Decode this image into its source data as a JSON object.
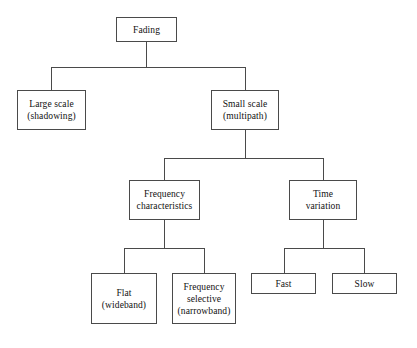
{
  "diagram": {
    "type": "hierarchy-tree",
    "colors": {
      "background": "#ffffff",
      "border": "#4a4a4a",
      "text": "#111111"
    },
    "nodes": [
      {
        "id": "fading",
        "lines": [
          "Fading"
        ],
        "x": 116,
        "y": 17,
        "w": 61,
        "h": 25,
        "level": 0
      },
      {
        "id": "large-scale",
        "lines": [
          "Large scale",
          "(shadowing)"
        ],
        "x": 17,
        "y": 90,
        "w": 69,
        "h": 40,
        "level": 1
      },
      {
        "id": "small-scale",
        "lines": [
          "Small scale",
          "(multipath)"
        ],
        "x": 211,
        "y": 90,
        "w": 68,
        "h": 40,
        "level": 1
      },
      {
        "id": "frequency-characteristics",
        "lines": [
          "Frequency",
          "characteristics"
        ],
        "x": 129,
        "y": 180,
        "w": 71,
        "h": 40,
        "level": 2
      },
      {
        "id": "time-variation",
        "lines": [
          "Time",
          "variation"
        ],
        "x": 289,
        "y": 180,
        "w": 68,
        "h": 40,
        "level": 2
      },
      {
        "id": "flat-wideband",
        "lines": [
          "Flat",
          "(wideband)"
        ],
        "x": 91,
        "y": 273,
        "w": 66,
        "h": 51,
        "level": 3
      },
      {
        "id": "frequency-selective-narrowband",
        "lines": [
          "Frequency",
          "selective",
          "(narrowband)"
        ],
        "x": 172,
        "y": 273,
        "w": 64,
        "h": 51,
        "level": 3
      },
      {
        "id": "fast",
        "lines": [
          "Fast"
        ],
        "x": 251,
        "y": 273,
        "w": 65,
        "h": 21,
        "level": 3
      },
      {
        "id": "slow",
        "lines": [
          "Slow"
        ],
        "x": 332,
        "y": 273,
        "w": 65,
        "h": 21,
        "level": 3
      }
    ],
    "connectors": [
      {
        "id": "fading-stem",
        "orient": "v",
        "x": 146,
        "y": 42,
        "len": 25
      },
      {
        "id": "level1-bus",
        "orient": "h",
        "x": 51,
        "y": 67,
        "len": 195
      },
      {
        "id": "large-scale-drop",
        "orient": "v",
        "x": 51,
        "y": 67,
        "len": 23
      },
      {
        "id": "small-scale-drop",
        "orient": "v",
        "x": 245,
        "y": 67,
        "len": 23
      },
      {
        "id": "small-scale-stem",
        "orient": "v",
        "x": 245,
        "y": 130,
        "len": 28
      },
      {
        "id": "level2-bus",
        "orient": "h",
        "x": 164,
        "y": 158,
        "len": 160
      },
      {
        "id": "freq-char-drop",
        "orient": "v",
        "x": 164,
        "y": 158,
        "len": 22
      },
      {
        "id": "time-var-drop",
        "orient": "v",
        "x": 323,
        "y": 158,
        "len": 22
      },
      {
        "id": "freq-char-stem",
        "orient": "v",
        "x": 164,
        "y": 220,
        "len": 28
      },
      {
        "id": "level3-left-bus",
        "orient": "h",
        "x": 124,
        "y": 248,
        "len": 81
      },
      {
        "id": "flat-drop",
        "orient": "v",
        "x": 124,
        "y": 248,
        "len": 25
      },
      {
        "id": "freq-selective-drop",
        "orient": "v",
        "x": 204,
        "y": 248,
        "len": 25
      },
      {
        "id": "time-var-stem",
        "orient": "v",
        "x": 323,
        "y": 220,
        "len": 28
      },
      {
        "id": "level3-right-bus",
        "orient": "h",
        "x": 284,
        "y": 248,
        "len": 81
      },
      {
        "id": "fast-drop",
        "orient": "v",
        "x": 284,
        "y": 248,
        "len": 25
      },
      {
        "id": "slow-drop",
        "orient": "v",
        "x": 364,
        "y": 248,
        "len": 25
      }
    ]
  }
}
